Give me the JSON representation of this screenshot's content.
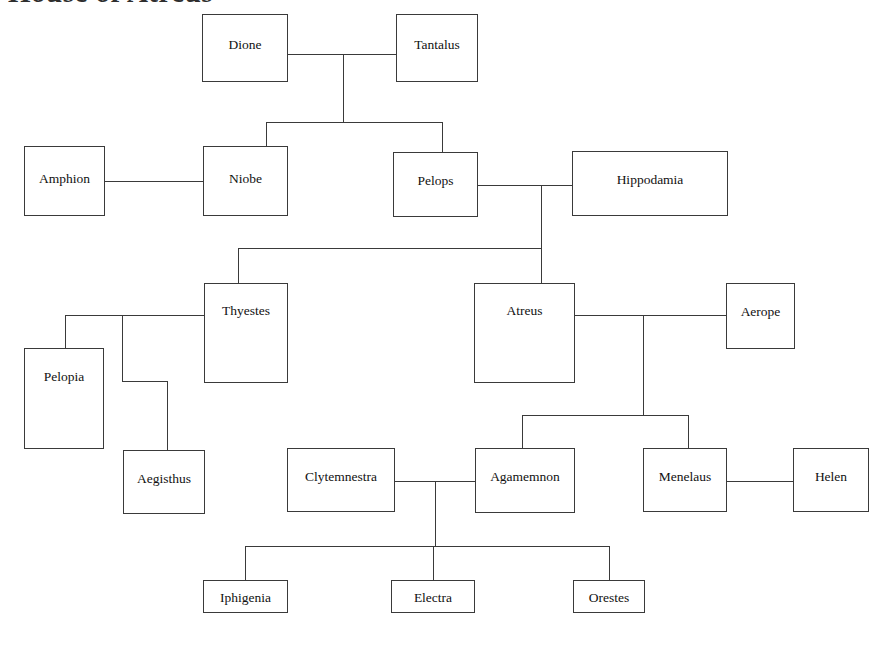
{
  "diagram": {
    "title": "House of Atreus",
    "kind": "family-tree",
    "background_color": "#ffffff",
    "line_color": "#3a3a3a",
    "text_color": "#111111"
  },
  "nodes": [
    {
      "id": "dione",
      "label": "Dione",
      "x": 202,
      "y": 14,
      "w": 86,
      "h": 68,
      "label_top": 22
    },
    {
      "id": "tantalus",
      "label": "Tantalus",
      "x": 396,
      "y": 14,
      "w": 82,
      "h": 68,
      "label_top": 22
    },
    {
      "id": "amphion",
      "label": "Amphion",
      "x": 24,
      "y": 146,
      "w": 81,
      "h": 70,
      "label_top": 24
    },
    {
      "id": "niobe",
      "label": "Niobe",
      "x": 203,
      "y": 146,
      "w": 85,
      "h": 70,
      "label_top": 24
    },
    {
      "id": "pelops",
      "label": "Pelops",
      "x": 393,
      "y": 152,
      "w": 85,
      "h": 65,
      "label_top": 20
    },
    {
      "id": "hippodamia",
      "label": "Hippodamia",
      "x": 572,
      "y": 151,
      "w": 156,
      "h": 65,
      "label_top": 20
    },
    {
      "id": "thyestes",
      "label": "Thyestes",
      "x": 204,
      "y": 283,
      "w": 84,
      "h": 100,
      "label_top": 19
    },
    {
      "id": "atreus",
      "label": "Atreus",
      "x": 474,
      "y": 283,
      "w": 101,
      "h": 100,
      "label_top": 19
    },
    {
      "id": "aerope",
      "label": "Aerope",
      "x": 726,
      "y": 283,
      "w": 69,
      "h": 66,
      "label_top": 20
    },
    {
      "id": "pelopia",
      "label": "Pelopia",
      "x": 24,
      "y": 348,
      "w": 80,
      "h": 101,
      "label_top": 20
    },
    {
      "id": "aegisthus",
      "label": "Aegisthus",
      "x": 123,
      "y": 450,
      "w": 82,
      "h": 64,
      "label_top": 20
    },
    {
      "id": "clytemnestra",
      "label": "Clytemnestra",
      "x": 287,
      "y": 448,
      "w": 108,
      "h": 64,
      "label_top": 20
    },
    {
      "id": "agamemnon",
      "label": "Agamemnon",
      "x": 475,
      "y": 448,
      "w": 100,
      "h": 65,
      "label_top": 20
    },
    {
      "id": "menelaus",
      "label": "Menelaus",
      "x": 643,
      "y": 448,
      "w": 84,
      "h": 64,
      "label_top": 20
    },
    {
      "id": "helen",
      "label": "Helen",
      "x": 793,
      "y": 448,
      "w": 76,
      "h": 64,
      "label_top": 20
    },
    {
      "id": "iphigenia",
      "label": "Iphigenia",
      "x": 203,
      "y": 580,
      "w": 85,
      "h": 33,
      "label_top": 9
    },
    {
      "id": "electra",
      "label": "Electra",
      "x": 391,
      "y": 580,
      "w": 84,
      "h": 33,
      "label_top": 9
    },
    {
      "id": "orestes",
      "label": "Orestes",
      "x": 573,
      "y": 580,
      "w": 72,
      "h": 33,
      "label_top": 9
    }
  ],
  "edges": [
    {
      "id": "dione-tantalus-marriage",
      "orient": "h",
      "x": 288,
      "y": 54,
      "len": 108
    },
    {
      "id": "dione-tantalus-descend",
      "orient": "v",
      "x": 343,
      "y": 54,
      "len": 68
    },
    {
      "id": "tantalus-children-bar",
      "orient": "h",
      "x": 266,
      "y": 122,
      "len": 176
    },
    {
      "id": "niobe-riser",
      "orient": "v",
      "x": 266,
      "y": 122,
      "len": 24
    },
    {
      "id": "pelops-riser",
      "orient": "v",
      "x": 442,
      "y": 122,
      "len": 30
    },
    {
      "id": "amphion-niobe-marriage",
      "orient": "h",
      "x": 105,
      "y": 181,
      "len": 98
    },
    {
      "id": "pelops-hippodamia-marriage",
      "orient": "h",
      "x": 478,
      "y": 185,
      "len": 94
    },
    {
      "id": "pelops-hippodamia-descend",
      "orient": "v",
      "x": 541,
      "y": 185,
      "len": 63
    },
    {
      "id": "atreus-thyestes-bar",
      "orient": "h",
      "x": 238,
      "y": 248,
      "len": 304
    },
    {
      "id": "thyestes-riser",
      "orient": "v",
      "x": 238,
      "y": 248,
      "len": 35
    },
    {
      "id": "atreus-riser",
      "orient": "v",
      "x": 541,
      "y": 248,
      "len": 35
    },
    {
      "id": "thyestes-pelopia-bar",
      "orient": "h",
      "x": 65,
      "y": 315,
      "len": 139
    },
    {
      "id": "pelopia-riser",
      "orient": "v",
      "x": 65,
      "y": 315,
      "len": 33
    },
    {
      "id": "aegisthus-stem-upper",
      "orient": "v",
      "x": 122,
      "y": 315,
      "len": 66
    },
    {
      "id": "aegisthus-stem-jog",
      "orient": "h",
      "x": 122,
      "y": 381,
      "len": 46
    },
    {
      "id": "aegisthus-stem-lower",
      "orient": "v",
      "x": 167,
      "y": 381,
      "len": 69
    },
    {
      "id": "atreus-aerope-marriage",
      "orient": "h",
      "x": 575,
      "y": 315,
      "len": 151
    },
    {
      "id": "atreus-aerope-descend",
      "orient": "v",
      "x": 643,
      "y": 315,
      "len": 100
    },
    {
      "id": "atreus-children-bar",
      "orient": "h",
      "x": 522,
      "y": 415,
      "len": 166
    },
    {
      "id": "agamemnon-riser",
      "orient": "v",
      "x": 522,
      "y": 415,
      "len": 33
    },
    {
      "id": "menelaus-riser",
      "orient": "v",
      "x": 688,
      "y": 415,
      "len": 33
    },
    {
      "id": "clytemnestra-marriage",
      "orient": "h",
      "x": 395,
      "y": 481,
      "len": 80
    },
    {
      "id": "clytemnestra-descend",
      "orient": "v",
      "x": 435,
      "y": 481,
      "len": 65
    },
    {
      "id": "menelaus-helen-marriage",
      "orient": "h",
      "x": 727,
      "y": 481,
      "len": 66
    },
    {
      "id": "children-bar-bottom",
      "orient": "h",
      "x": 245,
      "y": 546,
      "len": 365
    },
    {
      "id": "iphigenia-riser",
      "orient": "v",
      "x": 245,
      "y": 546,
      "len": 34
    },
    {
      "id": "electra-riser",
      "orient": "v",
      "x": 433,
      "y": 546,
      "len": 34
    },
    {
      "id": "orestes-riser",
      "orient": "v",
      "x": 609,
      "y": 546,
      "len": 34
    }
  ]
}
